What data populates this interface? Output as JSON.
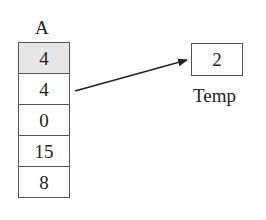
{
  "array": {
    "name": "A",
    "cells": [
      {
        "value": "4",
        "highlighted": true
      },
      {
        "value": "4",
        "highlighted": false
      },
      {
        "value": "0",
        "highlighted": false
      },
      {
        "value": "15",
        "highlighted": false
      },
      {
        "value": "8",
        "highlighted": false
      }
    ]
  },
  "temp": {
    "name": "Temp",
    "value": "2"
  },
  "arrow": {
    "from": "A[1]",
    "to": "Temp"
  },
  "colors": {
    "highlight": "#e6e6e6",
    "border": "#555555"
  }
}
